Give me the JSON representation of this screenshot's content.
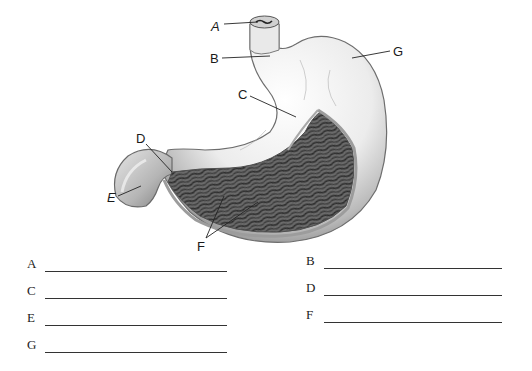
{
  "diagram": {
    "labels": [
      {
        "id": "A",
        "text": "A",
        "italic": true
      },
      {
        "id": "B",
        "text": "B",
        "italic": false
      },
      {
        "id": "C",
        "text": "C",
        "italic": false
      },
      {
        "id": "D",
        "text": "D",
        "italic": false
      },
      {
        "id": "E",
        "text": "E",
        "italic": true
      },
      {
        "id": "F",
        "text": "F",
        "italic": false
      },
      {
        "id": "G",
        "text": "G",
        "italic": false
      }
    ]
  },
  "answer_blanks": {
    "left": [
      {
        "letter": "A",
        "value": ""
      },
      {
        "letter": "C",
        "value": ""
      },
      {
        "letter": "E",
        "value": ""
      },
      {
        "letter": "G",
        "value": ""
      }
    ],
    "right": [
      {
        "letter": "B",
        "value": ""
      },
      {
        "letter": "D",
        "value": ""
      },
      {
        "letter": "F",
        "value": ""
      }
    ]
  }
}
